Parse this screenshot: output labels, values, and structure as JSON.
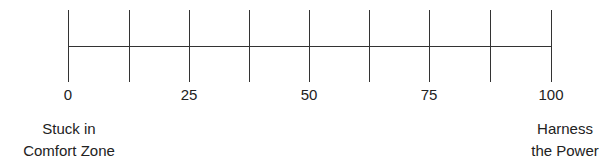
{
  "scale": {
    "min": 0,
    "max": 100,
    "tick_positions": [
      0,
      12.5,
      25,
      37.5,
      50,
      62.5,
      75,
      87.5,
      100
    ],
    "labels": [
      {
        "value": 0,
        "text": "0"
      },
      {
        "value": 25,
        "text": "25"
      },
      {
        "value": 50,
        "text": "50"
      },
      {
        "value": 75,
        "text": "75"
      },
      {
        "value": 100,
        "text": "100"
      }
    ]
  },
  "left_anchor": {
    "line1": "Stuck in",
    "line2": "Comfort Zone"
  },
  "right_anchor": {
    "line1": "Harness",
    "line2": "the Power"
  },
  "colors": {
    "line": "#333333",
    "text": "#222222"
  }
}
